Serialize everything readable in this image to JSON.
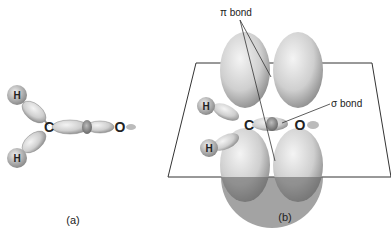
{
  "diagram": {
    "panels": [
      {
        "label": "(a)",
        "atoms": [
          "H",
          "H",
          "C",
          "O"
        ]
      },
      {
        "label": "(b)",
        "atoms": [
          "H",
          "H",
          "C",
          "O"
        ],
        "annotations": {
          "pi": "π bond",
          "sigma": "σ bond"
        }
      }
    ]
  }
}
